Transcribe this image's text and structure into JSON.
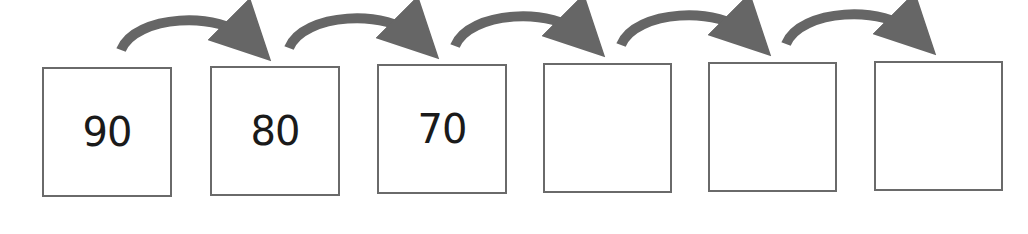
{
  "diagram": {
    "type": "number-sequence-skip-counting",
    "arrow_color": "#666666",
    "box_border_color": "#6a6a6a",
    "boxes": [
      {
        "value": "90"
      },
      {
        "value": "80"
      },
      {
        "value": "70"
      },
      {
        "value": ""
      },
      {
        "value": ""
      },
      {
        "value": ""
      }
    ],
    "arrow_count": 5
  }
}
